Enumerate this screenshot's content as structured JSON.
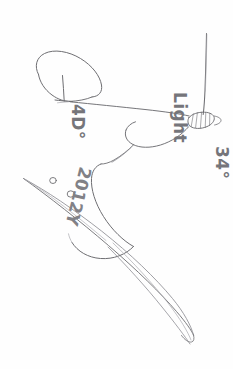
{
  "page": {
    "medium": "graphite pencil on white paper",
    "orientation_note": "handwriting rotated 90 degrees clockwise relative to page",
    "background_color": "#fefefe",
    "ink_color": "#6e6e72"
  },
  "annotations": {
    "light_label": "Light",
    "angle_right_label": "34°",
    "angle_left_label": "4D°",
    "code_label": "2012Y"
  },
  "drawing": {
    "elements": [
      {
        "name": "upper-loop-outline",
        "kind": "closed-loop"
      },
      {
        "name": "tick-mark-upper",
        "kind": "cross-tick"
      },
      {
        "name": "long-straight-stem",
        "kind": "line"
      },
      {
        "name": "hatched-clamp",
        "kind": "shaded-block"
      },
      {
        "name": "curved-neck",
        "kind": "curve"
      },
      {
        "name": "lower-lobe-outline",
        "kind": "closed-loop"
      },
      {
        "name": "needle-shaft",
        "kind": "tapered-blade"
      },
      {
        "name": "needle-eye",
        "kind": "small-circle"
      },
      {
        "name": "tail-blade",
        "kind": "tapered-blade"
      }
    ]
  }
}
